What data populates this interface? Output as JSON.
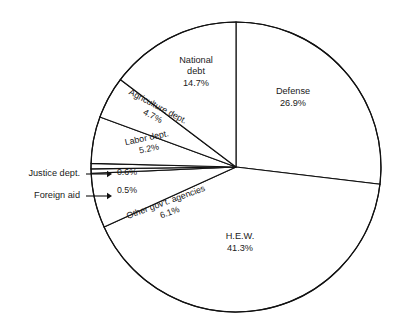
{
  "chart_data": {
    "type": "pie",
    "title": "",
    "subtitle": "",
    "xlabel": "",
    "ylabel": "",
    "legend_position": "none",
    "grid": false,
    "units": "percent",
    "total": 100.0,
    "start_angle_deg": 0,
    "direction": "clockwise",
    "categories": [
      "Defense",
      "H.E.W.",
      "Other gov't. agencies",
      "Foreign aid",
      "Justice dept.",
      "Labor dept.",
      "Agriculture dept.",
      "National debt"
    ],
    "values": [
      26.9,
      41.3,
      6.1,
      0.5,
      0.6,
      5.2,
      4.7,
      14.7
    ],
    "slices": [
      {
        "name": "defense",
        "label": "Defense",
        "value": 26.9,
        "value_text": "26.9%",
        "label_placement": "inside",
        "label_rotation_deg": 0,
        "label_x": 293,
        "label_y": 98,
        "line_height": 11.5
      },
      {
        "name": "hew",
        "label": "H.E.W.",
        "value": 41.3,
        "value_text": "41.3%",
        "label_placement": "inside",
        "label_rotation_deg": 0,
        "label_x": 240,
        "label_y": 243,
        "line_height": 11.5
      },
      {
        "name": "other-govt-agencies",
        "label": "Other gov't. agencies",
        "value": 6.1,
        "value_text": "6.1%",
        "label_placement": "inside-rotated",
        "label_rotation_deg": -20,
        "label_x": 168,
        "label_y": 208,
        "line_height": 11.0
      },
      {
        "name": "foreign-aid",
        "label": "Foreign aid",
        "value": 0.5,
        "value_text": "0.5%",
        "label_placement": "callout-left",
        "label_rotation_deg": 0,
        "label_x": 127,
        "label_y": 191,
        "callout_text_x": 80,
        "callout_text_y": 196,
        "line_height": 11.0
      },
      {
        "name": "justice-dept",
        "label": "Justice dept.",
        "value": 0.6,
        "value_text": "0.6%",
        "label_placement": "callout-left",
        "label_rotation_deg": 0,
        "label_x": 127,
        "label_y": 173,
        "callout_text_x": 80,
        "callout_text_y": 174,
        "line_height": 11.0
      },
      {
        "name": "labor-dept",
        "label": "Labor dept.",
        "value": 5.2,
        "value_text": "5.2%",
        "label_placement": "inside-rotated",
        "label_rotation_deg": -12,
        "label_x": 148,
        "label_y": 144,
        "line_height": 11.0
      },
      {
        "name": "agriculture-dept",
        "label": "Agriculture dept.",
        "value": 4.7,
        "value_text": "4.7%",
        "label_placement": "inside-rotated",
        "label_rotation_deg": 28,
        "label_x": 155,
        "label_y": 112,
        "line_height": 11.0
      },
      {
        "name": "national-debt",
        "label": "National debt",
        "value": 14.7,
        "value_text": "14.7%",
        "label_placement": "inside",
        "label_rotation_deg": 0,
        "label_x": 196,
        "label_y": 72,
        "line_height": 11.5
      }
    ],
    "geometry": {
      "center_x": 236,
      "center_y": 167,
      "radius": 145
    },
    "colors": {
      "slice_fill": "#ffffff",
      "slice_stroke": "#111111",
      "text": "#1a1a1a",
      "background": "#ffffff"
    }
  }
}
